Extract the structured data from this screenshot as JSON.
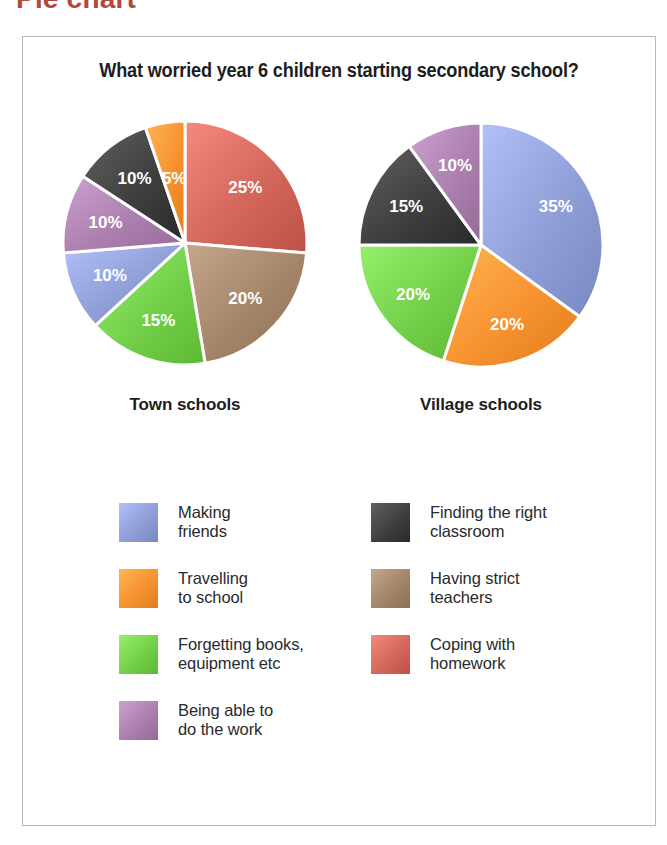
{
  "page_heading": "Pie chart",
  "chart_title": "What worried year 6 children starting secondary school?",
  "captions": {
    "town": "Town schools",
    "village": "Village schools"
  },
  "colors": {
    "making_friends": "#8f9ed6",
    "making_friends_light": "#bcd7ef",
    "travelling": "#f79230",
    "travelling_light": "#fbbf6b",
    "forgetting": "#73cf4a",
    "forgetting_light": "#aee87d",
    "being_able": "#ab7fae",
    "being_able_light": "#c9a6c8",
    "finding_classroom": "#3f3f3f",
    "finding_classroom_light": "#6d6d6d",
    "having_strict": "#a3866a",
    "having_strict_light": "#c3ab8d",
    "coping_homework": "#d4675c",
    "coping_homework_light": "#f08b7c",
    "frame_border": "#b9b9b9",
    "heading_red": "#b2483c",
    "text": "#1d1d1d",
    "slice_label": "#ffffff"
  },
  "legend": {
    "left": [
      {
        "label_line1": "Making",
        "label_line2": "friends",
        "key": "making_friends",
        "swatch_name": "legend-swatch-making-friends"
      },
      {
        "label_line1": "Travelling",
        "label_line2": "to school",
        "key": "travelling",
        "swatch_name": "legend-swatch-travelling"
      },
      {
        "label_line1": "Forgetting books,",
        "label_line2": "equipment etc",
        "key": "forgetting",
        "swatch_name": "legend-swatch-forgetting"
      },
      {
        "label_line1": "Being able to",
        "label_line2": "do the work",
        "key": "being_able",
        "swatch_name": "legend-swatch-being-able"
      }
    ],
    "right": [
      {
        "label_line1": "Finding the right",
        "label_line2": "classroom",
        "key": "finding_classroom",
        "swatch_name": "legend-swatch-finding-classroom"
      },
      {
        "label_line1": "Having strict",
        "label_line2": "teachers",
        "key": "having_strict",
        "swatch_name": "legend-swatch-having-strict"
      },
      {
        "label_line1": "Coping with",
        "label_line2": "homework",
        "key": "coping_homework",
        "swatch_name": "legend-swatch-coping-homework"
      }
    ]
  },
  "chart_data": [
    {
      "type": "pie",
      "title": "Town schools",
      "subtitle": "What worried year 6 children starting secondary school?",
      "start_angle_deg": 0,
      "direction": "clockwise",
      "legend_position": "bottom",
      "categories": [
        "Coping with homework",
        "Having strict teachers",
        "Forgetting books, equipment etc",
        "Making friends",
        "Being able to do the work",
        "Finding the right classroom",
        "Travelling to school"
      ],
      "values": [
        25,
        20,
        15,
        10,
        10,
        10,
        5
      ],
      "labels": [
        "25%",
        "20%",
        "15%",
        "10%",
        "10%",
        "10%",
        "5%"
      ],
      "colors": [
        "#d4675c",
        "#a3866a",
        "#73cf4a",
        "#8f9ed6",
        "#ab7fae",
        "#3f3f3f",
        "#f79230"
      ],
      "units": "percent"
    },
    {
      "type": "pie",
      "title": "Village schools",
      "subtitle": "What worried year 6 children starting secondary school?",
      "start_angle_deg": 0,
      "direction": "clockwise",
      "legend_position": "bottom",
      "categories": [
        "Making friends",
        "Travelling to school",
        "Forgetting books, equipment etc",
        "Finding the right classroom",
        "Being able to do the work"
      ],
      "values": [
        35,
        20,
        20,
        15,
        10
      ],
      "labels": [
        "35%",
        "20%",
        "20%",
        "15%",
        "10%"
      ],
      "colors": [
        "#8f9ed6",
        "#f79230",
        "#73cf4a",
        "#3f3f3f",
        "#ab7fae"
      ],
      "units": "percent"
    }
  ]
}
